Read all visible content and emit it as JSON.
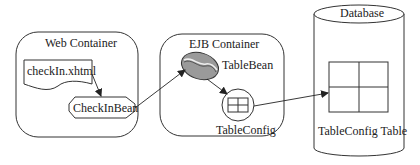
{
  "diagram": {
    "web_container": {
      "title": "Web Container",
      "page": "checkIn.xhtml",
      "bean": "CheckInBean"
    },
    "ejb_container": {
      "title": "EJB Container",
      "bean": "TableBean",
      "entity": "TableConfig"
    },
    "database": {
      "title": "Database",
      "table": "TableConfig Table"
    },
    "edges": [
      {
        "from": "checkIn.xhtml",
        "to": "CheckInBean"
      },
      {
        "from": "CheckInBean",
        "to": "TableBean"
      },
      {
        "from": "TableBean",
        "to": "TableConfig"
      },
      {
        "from": "TableConfig",
        "to": "TableConfig Table"
      }
    ]
  }
}
